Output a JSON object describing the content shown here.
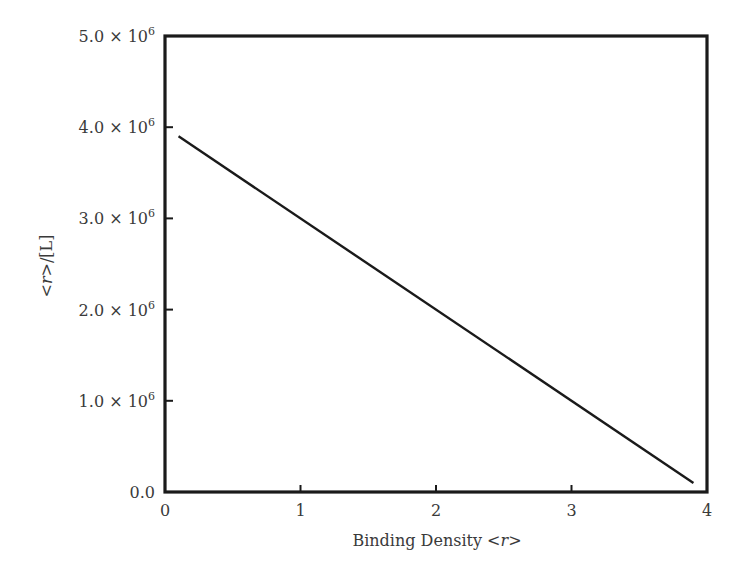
{
  "chart_data": {
    "type": "line",
    "title": "",
    "xlabel": "Binding Density <r>",
    "xlabel_parts": {
      "prefix": "Binding Density <",
      "italic": "r",
      "suffix": ">"
    },
    "ylabel": "<r>/[L]",
    "ylabel_parts": {
      "prefix": "<",
      "italic": "r",
      "suffix": ">/[L]"
    },
    "xlim": [
      0,
      4
    ],
    "ylim": [
      0,
      5000000
    ],
    "x_ticks": [
      0,
      1,
      2,
      3,
      4
    ],
    "x_tick_labels": [
      "0",
      "1",
      "2",
      "3",
      "4"
    ],
    "y_ticks": [
      0,
      1000000,
      2000000,
      3000000,
      4000000,
      5000000
    ],
    "y_tick_labels": [
      {
        "mantissa": "0.0",
        "exp": ""
      },
      {
        "mantissa": "1.0 × 10",
        "exp": "6"
      },
      {
        "mantissa": "2.0 × 10",
        "exp": "6"
      },
      {
        "mantissa": "3.0 × 10",
        "exp": "6"
      },
      {
        "mantissa": "4.0 × 10",
        "exp": "6"
      },
      {
        "mantissa": "5.0 × 10",
        "exp": "6"
      }
    ],
    "grid": false,
    "legend": null,
    "series": [
      {
        "name": "Scatchard line",
        "x": [
          0.1,
          3.9
        ],
        "y": [
          3900000,
          100000
        ],
        "color": "#1a1a1a"
      }
    ]
  },
  "layout": {
    "plot": {
      "left": 165,
      "top": 36,
      "right": 707,
      "bottom": 492
    },
    "axis_color": "#1a1a1a",
    "text_color": "#3a3a3a"
  }
}
